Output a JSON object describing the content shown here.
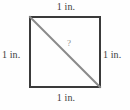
{
  "figure": {
    "type": "geometry-diagram",
    "shape": "square",
    "background_color": "#fefefe",
    "square": {
      "border_color": "#3a3a3a",
      "border_width_px": 2,
      "x_px": 29,
      "y_px": 16,
      "width_px": 72,
      "height_px": 72,
      "side_length_value": "1 in."
    },
    "diagonal": {
      "color": "#8a8a8a",
      "width_px": 2,
      "from": "top-left",
      "to": "bottom-right",
      "x1_px": 30,
      "y1_px": 17,
      "x2_px": 100,
      "y2_px": 87
    },
    "labels": {
      "top": "1 in.",
      "right": "1 in.",
      "bottom": "1 in.",
      "left": "1 in.",
      "text_color": "#3d3d3d"
    },
    "unknown": {
      "symbol": "?",
      "color": "#8a8a8a",
      "describes": "diagonal"
    }
  }
}
